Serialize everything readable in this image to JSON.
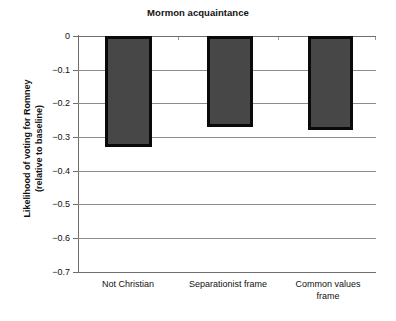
{
  "chart_data": {
    "type": "bar",
    "title": "Mormon acquaintance",
    "xlabel": "",
    "ylabel": "Likelihood of voting for Romney (relative to baseline)",
    "ylabel_line1": "Likelihood of voting for Romney",
    "ylabel_line2": "(relative to baseline)",
    "categories": [
      "Not Christian",
      "Separationist frame",
      "Common values frame"
    ],
    "values": [
      -0.33,
      -0.27,
      -0.28
    ],
    "ylim": [
      -0.7,
      0
    ],
    "ytick_values": [
      0,
      -0.1,
      -0.2,
      -0.3,
      -0.4,
      -0.5,
      -0.6,
      -0.7
    ],
    "ytick_labels": [
      "0",
      "−0.1",
      "−0.2",
      "−0.3",
      "−0.4",
      "−0.5",
      "−0.6",
      "−0.7"
    ],
    "grid": true,
    "legend": "none",
    "bar_fill_color": "#474747",
    "bar_border_color": "#0a0a0a",
    "gridline_color": "#8c8c8c",
    "axis_color": "#6f6f6f",
    "background_color": "#ffffff"
  },
  "categories_display": [
    {
      "line1": "Not Christian",
      "line2": ""
    },
    {
      "line1": "Separationist frame",
      "line2": ""
    },
    {
      "line1": "Common values",
      "line2": "frame"
    }
  ]
}
